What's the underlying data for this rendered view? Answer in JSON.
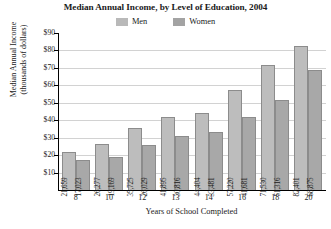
{
  "chart_data": {
    "type": "bar",
    "title": "Median Annual Income, by Level of Education, 2004",
    "xlabel": "Years of School Completed",
    "ylabel": "Median Annual Income\n(thousands of dollars)",
    "ylabel_line1": "Median Annual Income",
    "ylabel_line2": "(thousands of dollars)",
    "categories": [
      "8",
      "10",
      "12",
      "13",
      "14",
      "16",
      "18",
      "20"
    ],
    "series": [
      {
        "name": "Men",
        "color": "#bdbdbd",
        "values": [
          21659,
          26277,
          35725,
          41895,
          44404,
          57220,
          71530,
          82401
        ],
        "labels": [
          "21,659",
          "26,277",
          "35,725",
          "41,895",
          "44,404",
          "57,220",
          "71,530",
          "82,401"
        ]
      },
      {
        "name": "Women",
        "color": "#a8a8a8",
        "values": [
          17023,
          19169,
          26029,
          30816,
          33481,
          41681,
          51316,
          68875
        ],
        "labels": [
          "17,023",
          "19,169",
          "26,029",
          "30,816",
          "33,481",
          "41,681",
          "51,316",
          "68,875"
        ]
      }
    ],
    "ylim": [
      0,
      90000
    ],
    "y_ticks": [
      10000,
      20000,
      30000,
      40000,
      50000,
      60000,
      70000,
      80000,
      90000
    ],
    "y_tick_labels": [
      "$10",
      "$20",
      "$30",
      "$40",
      "$50",
      "$60",
      "$70",
      "$80",
      "$90"
    ],
    "grid": true,
    "legend_position": "top-center",
    "units": "thousands of dollars"
  },
  "legend": {
    "entries": [
      {
        "label": "Men"
      },
      {
        "label": "Women"
      }
    ]
  }
}
